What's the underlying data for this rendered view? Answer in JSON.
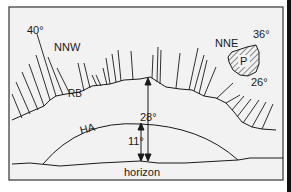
{
  "diagram": {
    "labels": {
      "angle_top_left": "40°",
      "direction_left": "NNW",
      "direction_right": "NNE",
      "angle_top_right": "36°",
      "angle_lower_right": "26°",
      "patch": "P",
      "ridge_band": "RB",
      "horizon_arc": "HA",
      "angle_total": "28°",
      "angle_arc": "11°",
      "horizon": "horizon"
    },
    "colors": {
      "ink": "#1a1a1a",
      "panel": "#f2f2f2",
      "frame": "#333333"
    }
  }
}
